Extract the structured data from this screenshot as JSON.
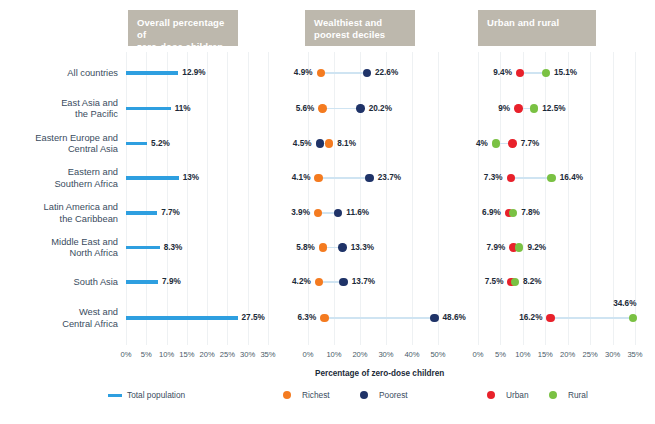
{
  "panels": [
    {
      "title": "Overall percentage of\nzero-dose children",
      "axis_min": 0,
      "axis_max": 35,
      "ticks": [
        "0%",
        "5%",
        "10%",
        "15%",
        "20%",
        "25%",
        "30%",
        "35%"
      ]
    },
    {
      "title": "Wealthiest and\npoorest deciles",
      "axis_min": 0,
      "axis_max": 50,
      "ticks": [
        "0%",
        "10%",
        "20%",
        "30%",
        "40%",
        "50%"
      ]
    },
    {
      "title": "Urban and rural",
      "axis_min": 0,
      "axis_max": 35,
      "ticks": [
        "0%",
        "5%",
        "10%",
        "15%",
        "20%",
        "25%",
        "30%",
        "35%"
      ]
    }
  ],
  "axis_title": "Percentage of zero-dose children",
  "legend": [
    {
      "name": "Total population",
      "type": "line",
      "color": "#2e9fe0"
    },
    {
      "name": "Richest",
      "type": "dot",
      "color": "#f47b20"
    },
    {
      "name": "Poorest",
      "type": "dot",
      "color": "#1f3368"
    },
    {
      "name": "Urban",
      "type": "dot",
      "color": "#e8212b"
    },
    {
      "name": "Rural",
      "type": "dot",
      "color": "#7ac143"
    }
  ],
  "rows": [
    "All countries",
    "East Asia and\nthe Pacific",
    "Eastern Europe and\nCentral Asia",
    "Eastern and\nSouthern Africa",
    "Latin America and\nthe Caribbean",
    "Middle East and\nNorth Africa",
    "South Asia",
    "West and\nCentral Africa"
  ],
  "chart_data": {
    "type": "bar",
    "xlabel": "Percentage of zero-dose children",
    "ylabel": "",
    "categories": [
      "All countries",
      "East Asia and the Pacific",
      "Eastern Europe and Central Asia",
      "Eastern and Southern Africa",
      "Latin America and the Caribbean",
      "Middle East and North Africa",
      "South Asia",
      "West and Central Africa"
    ],
    "panels": [
      {
        "name": "Overall percentage of zero-dose children",
        "type": "bar",
        "xlim": [
          0,
          35
        ],
        "xticks": [
          0,
          5,
          10,
          15,
          20,
          25,
          30,
          35
        ],
        "series": [
          {
            "name": "Total population",
            "color": "#2e9fe0",
            "values": [
              12.9,
              11,
              5.2,
              13,
              7.7,
              8.3,
              7.9,
              27.5
            ],
            "labels": [
              "12.9%",
              "11%",
              "5.2%",
              "13%",
              "7.7%",
              "8.3%",
              "7.9%",
              "27.5%"
            ]
          }
        ]
      },
      {
        "name": "Wealthiest and poorest deciles",
        "type": "scatter",
        "xlim": [
          0,
          50
        ],
        "xticks": [
          0,
          10,
          20,
          30,
          40,
          50
        ],
        "series": [
          {
            "name": "Richest",
            "color": "#f47b20",
            "values": [
              4.9,
              5.6,
              8.1,
              4.1,
              3.9,
              5.8,
              4.2,
              6.3
            ],
            "labels": [
              "4.9%",
              "5.6%",
              "8.1%",
              "4.1%",
              "3.9%",
              "5.8%",
              "4.2%",
              "6.3%"
            ]
          },
          {
            "name": "Poorest",
            "color": "#1f3368",
            "values": [
              22.6,
              20.2,
              4.5,
              23.7,
              11.6,
              13.3,
              13.7,
              48.6
            ],
            "labels": [
              "22.6%",
              "20.2%",
              "4.5%",
              "23.7%",
              "11.6%",
              "13.3%",
              "13.7%",
              "48.6%"
            ]
          }
        ]
      },
      {
        "name": "Urban and rural",
        "type": "scatter",
        "xlim": [
          0,
          35
        ],
        "xticks": [
          0,
          5,
          10,
          15,
          20,
          25,
          30,
          35
        ],
        "series": [
          {
            "name": "Urban",
            "color": "#e8212b",
            "values": [
              9.4,
              9,
              7.7,
              7.3,
              6.9,
              7.9,
              7.5,
              16.2
            ],
            "labels": [
              "9.4%",
              "9%",
              "7.7%",
              "7.3%",
              "6.9%",
              "7.9%",
              "7.5%",
              "16.2%"
            ]
          },
          {
            "name": "Rural",
            "color": "#7ac143",
            "values": [
              15.1,
              12.5,
              4,
              16.4,
              7.8,
              9.2,
              8.2,
              34.6
            ],
            "labels": [
              "15.1%",
              "12.5%",
              "4%",
              "16.4%",
              "7.8%",
              "9.2%",
              "8.2%",
              "34.6%"
            ]
          }
        ]
      }
    ]
  }
}
